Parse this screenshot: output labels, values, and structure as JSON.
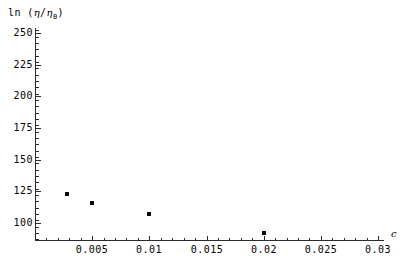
{
  "chart_data": {
    "type": "scatter",
    "title": "",
    "subtitle": "",
    "ylabel": "ln (η/η₀)",
    "ylabel_parts": {
      "prefix": "ln  (",
      "eta1": "η",
      "slash": "/",
      "eta2": "η",
      "sub": "0",
      "suffix": ")"
    },
    "xlabel": "c",
    "x": [
      0.0028,
      0.005,
      0.01,
      0.02
    ],
    "y": [
      123,
      116,
      107,
      92
    ],
    "points": [
      {
        "x": 0.0028,
        "y": 123
      },
      {
        "x": 0.005,
        "y": 116
      },
      {
        "x": 0.01,
        "y": 107
      },
      {
        "x": 0.02,
        "y": 92
      }
    ],
    "xlim": [
      0.0,
      0.03
    ],
    "ylim": [
      87,
      256
    ],
    "xticks": [
      0.005,
      0.01,
      0.015,
      0.02,
      0.025,
      0.03
    ],
    "xtick_labels": [
      "0.005",
      "0.01",
      "0.015",
      "0.02",
      "0.025",
      "0.03"
    ],
    "yticks": [
      100,
      125,
      150,
      175,
      200,
      225,
      250
    ],
    "ytick_labels": [
      "100",
      "125",
      "150",
      "175",
      "200",
      "225",
      "250"
    ],
    "x_minor_step": 0.001,
    "y_minor_step": 5,
    "grid": false,
    "legend": null,
    "marker": "square",
    "marker_color": "#0a0a0a",
    "axis_color": "#2b2b2b"
  }
}
